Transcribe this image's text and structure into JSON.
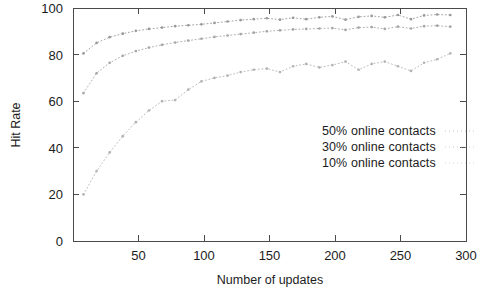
{
  "chart_data": {
    "type": "line",
    "title": "",
    "xlabel": "Number of updates",
    "ylabel": "Hit Rate",
    "xlim": [
      0,
      300
    ],
    "ylim": [
      0,
      100
    ],
    "xticks": [
      50,
      100,
      150,
      200,
      250,
      300
    ],
    "yticks": [
      0,
      20,
      40,
      60,
      80,
      100
    ],
    "xtick_labels": [
      "50",
      "100",
      "150",
      "200",
      "250",
      "300"
    ],
    "ytick_labels": [
      "0",
      "20",
      "40",
      "60",
      "80",
      "100"
    ],
    "grid": false,
    "legend_position": "center-right-inside",
    "marker": "dot",
    "line_style": "dotted",
    "series": [
      {
        "name": "50% online contacts",
        "color": "#9a9a9a",
        "x": [
          8,
          18,
          28,
          38,
          48,
          58,
          68,
          78,
          88,
          98,
          108,
          118,
          128,
          138,
          148,
          158,
          168,
          178,
          188,
          198,
          208,
          218,
          228,
          238,
          248,
          258,
          268,
          278,
          288
        ],
        "y": [
          80.5,
          85.0,
          87.5,
          89.0,
          90.2,
          91.0,
          91.6,
          92.2,
          92.6,
          93.0,
          93.6,
          94.2,
          94.8,
          95.2,
          95.6,
          95.0,
          95.8,
          95.2,
          96.0,
          96.4,
          95.0,
          96.2,
          96.6,
          96.0,
          97.0,
          95.2,
          96.8,
          97.2,
          97.0
        ]
      },
      {
        "name": "30% online contacts",
        "color": "#a6a6a6",
        "x": [
          8,
          18,
          28,
          38,
          48,
          58,
          68,
          78,
          88,
          98,
          108,
          118,
          128,
          138,
          148,
          158,
          168,
          178,
          188,
          198,
          208,
          218,
          228,
          238,
          248,
          258,
          268,
          278,
          288
        ],
        "y": [
          63.5,
          72.0,
          76.5,
          79.5,
          81.5,
          83.0,
          84.2,
          85.2,
          86.0,
          86.8,
          87.6,
          88.2,
          88.8,
          89.4,
          90.0,
          90.4,
          90.8,
          91.0,
          91.2,
          91.4,
          90.6,
          91.6,
          91.8,
          91.0,
          92.0,
          91.2,
          92.2,
          92.4,
          92.0
        ]
      },
      {
        "name": "10% online contacts",
        "color": "#b4b4b4",
        "x": [
          8,
          18,
          28,
          38,
          48,
          58,
          68,
          78,
          88,
          98,
          108,
          118,
          128,
          138,
          148,
          158,
          168,
          178,
          188,
          198,
          208,
          218,
          228,
          238,
          248,
          258,
          268,
          278,
          288
        ],
        "y": [
          20.0,
          30.0,
          38.0,
          45.0,
          51.0,
          56.0,
          60.0,
          60.5,
          65.0,
          68.5,
          70.0,
          71.0,
          72.5,
          73.5,
          74.0,
          72.5,
          75.0,
          76.0,
          74.5,
          75.5,
          77.0,
          73.5,
          76.0,
          77.0,
          75.0,
          73.0,
          76.5,
          78.0,
          80.5
        ]
      }
    ]
  },
  "legend": {
    "items": [
      {
        "label": "50% online contacts"
      },
      {
        "label": "30% online contacts"
      },
      {
        "label": "10% online contacts"
      }
    ]
  }
}
